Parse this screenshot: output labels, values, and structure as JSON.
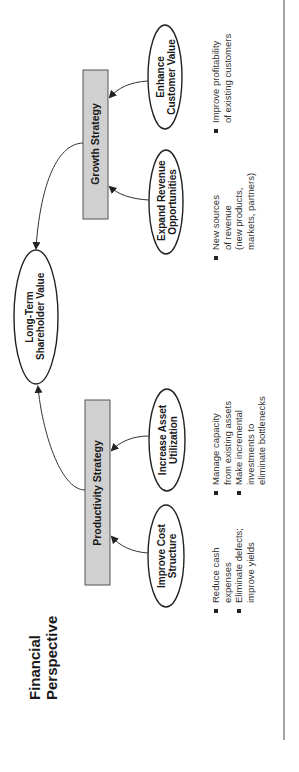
{
  "title": [
    "Financial",
    "Perspective"
  ],
  "center": {
    "label": [
      "Long-Term",
      "Shareholder Value"
    ]
  },
  "strategies": [
    {
      "name": "Growth Strategy",
      "objectives": [
        {
          "label": [
            "Enhance",
            "Customer Value"
          ],
          "bullets": [
            [
              "Improve profitability",
              "of existing customers"
            ]
          ]
        },
        {
          "label": [
            "Expand Revenue",
            "Opportunities"
          ],
          "bullets": [
            [
              "New sources",
              "of revenue",
              "(new products,",
              "markets, partners)"
            ]
          ]
        }
      ]
    },
    {
      "name": "Productivity Strategy",
      "objectives": [
        {
          "label": [
            "Increase Asset",
            "Utilization"
          ],
          "bullets": [
            [
              "Manage capacity",
              "from existing assets"
            ],
            [
              "Make incremental",
              "investments to",
              "eliminate bottlenecks"
            ]
          ]
        },
        {
          "label": [
            "Improve Cost",
            "Structure"
          ],
          "bullets": [
            [
              "Reduce cash",
              "expenses"
            ],
            [
              "Eliminate defects;",
              "improve yields"
            ]
          ]
        }
      ]
    }
  ],
  "colors": {
    "box_fill": "#d0d0d0",
    "stroke": "#333333"
  }
}
